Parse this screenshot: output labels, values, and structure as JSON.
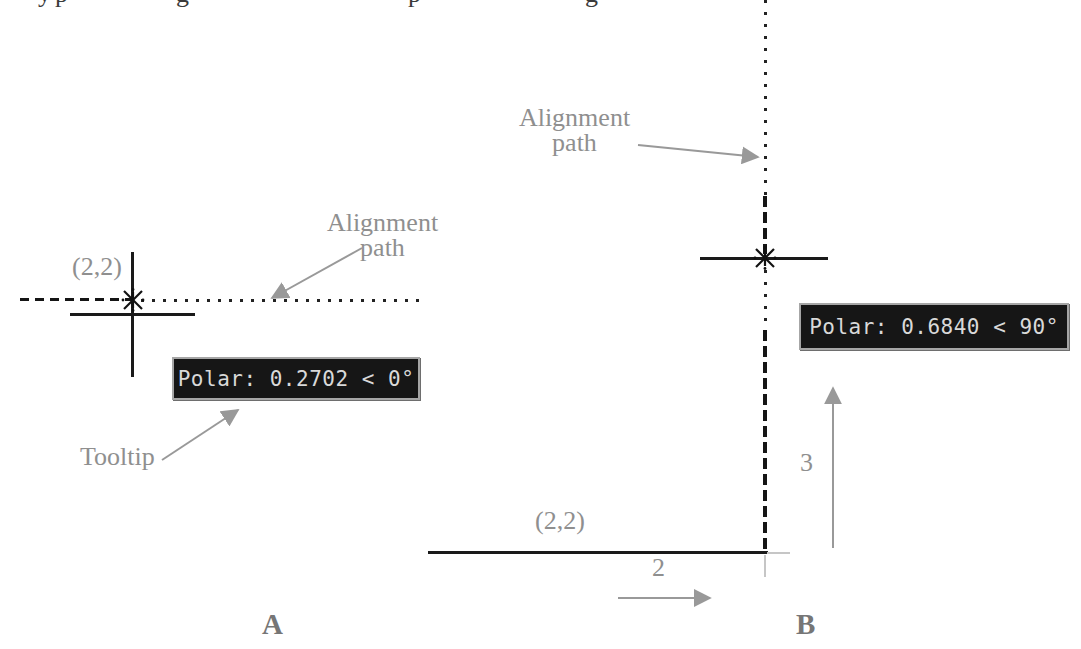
{
  "figure": {
    "background": "#ffffff",
    "cropped_text_fragments": [
      "y",
      "p",
      "g",
      "p",
      "g"
    ],
    "colors": {
      "label_gray": "#8f8f8f",
      "figure_label_gray": "#767676",
      "line_black": "#1a1a1a",
      "arrow_gray": "#999999",
      "tooltip_bg": "#161616",
      "tooltip_text": "#d9d9d9",
      "tooltip_border": "#a6a6a6"
    }
  },
  "diagram_a": {
    "figure_label": "A",
    "start_point_label": "(2,2)",
    "alignment_path_label": {
      "line1": "Alignment",
      "line2": "path"
    },
    "tooltip": {
      "text": "Polar: 0.2702 < 0°"
    },
    "tooltip_callout_label": "Tooltip"
  },
  "diagram_b": {
    "figure_label": "B",
    "start_point_label": "(2,2)",
    "alignment_path_label": {
      "line1": "Alignment",
      "line2": "path"
    },
    "tooltip": {
      "text": "Polar: 0.6840 < 90°"
    },
    "horizontal_distance_label": "2",
    "vertical_distance_label": "3"
  }
}
